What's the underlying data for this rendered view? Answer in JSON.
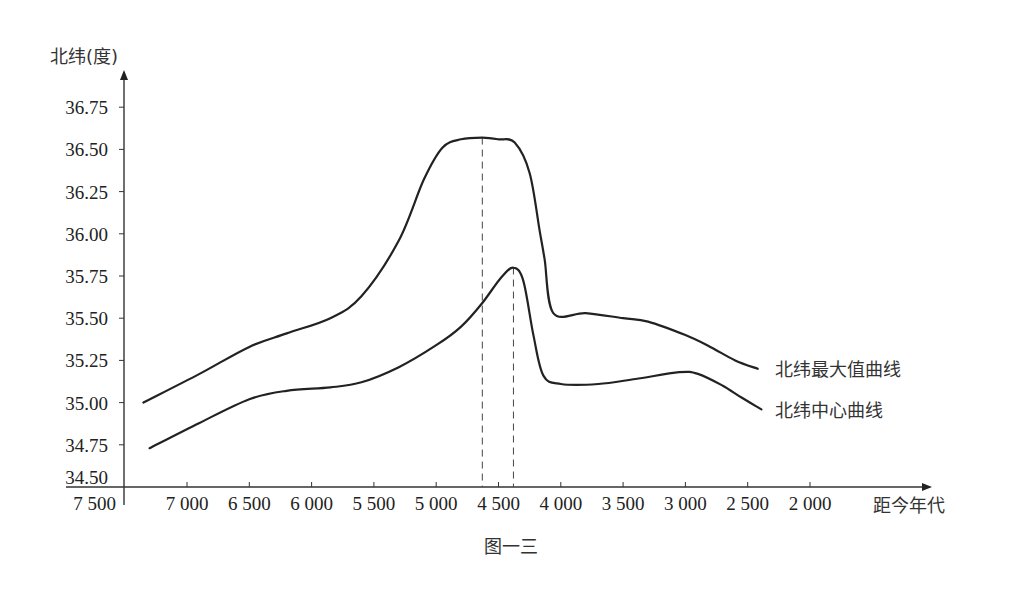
{
  "chart_data": {
    "type": "line",
    "title": "",
    "caption": "图一三",
    "xlabel": "距今年代",
    "ylabel": "北纬(度)",
    "x_reversed": true,
    "xlim": [
      7500,
      1500
    ],
    "ylim": [
      34.5,
      36.9
    ],
    "x_ticks": [
      7500,
      7000,
      6500,
      6000,
      5500,
      5000,
      4500,
      4000,
      3500,
      3000,
      2500,
      2000
    ],
    "x_tick_labels": [
      "7 500",
      "7 000",
      "6 500",
      "6 000",
      "5 500",
      "5 000",
      "4 500",
      "4 000",
      "3 500",
      "3 000",
      "2 500",
      "2 000"
    ],
    "y_ticks": [
      34.5,
      34.75,
      35.0,
      35.25,
      35.5,
      35.75,
      36.0,
      36.25,
      36.5,
      36.75
    ],
    "y_tick_labels": [
      "34.50",
      "34.75",
      "35.00",
      "35.25",
      "35.50",
      "35.75",
      "36.00",
      "36.25",
      "36.50",
      "36.75"
    ],
    "grid": false,
    "legend_position": "inline-right",
    "series": [
      {
        "name": "北纬最大值曲线",
        "x": [
          7350,
          6900,
          6500,
          6200,
          5850,
          5600,
          5300,
          5100,
          4950,
          4800,
          4630,
          4500,
          4370,
          4250,
          4170,
          4130,
          4060,
          3800,
          3500,
          3300,
          3000,
          2800,
          2600,
          2420
        ],
        "y": [
          35.0,
          35.17,
          35.33,
          35.41,
          35.5,
          35.63,
          35.96,
          36.32,
          36.51,
          36.56,
          36.57,
          36.56,
          36.54,
          36.36,
          36.02,
          35.85,
          35.53,
          35.53,
          35.5,
          35.48,
          35.4,
          35.33,
          35.25,
          35.2
        ]
      },
      {
        "name": "北纬中心曲线",
        "x": [
          7300,
          6900,
          6500,
          6200,
          5850,
          5600,
          5300,
          5000,
          4800,
          4630,
          4480,
          4380,
          4300,
          4220,
          4140,
          4000,
          3700,
          3400,
          3050,
          2900,
          2700,
          2550,
          2390
        ],
        "y": [
          34.73,
          34.88,
          35.02,
          35.07,
          35.09,
          35.12,
          35.21,
          35.34,
          35.45,
          35.59,
          35.74,
          35.8,
          35.72,
          35.4,
          35.16,
          35.11,
          35.11,
          35.14,
          35.18,
          35.17,
          35.1,
          35.03,
          34.96
        ]
      }
    ],
    "annotations": [
      {
        "type": "vline-dashed",
        "x": 4630,
        "note": "peak of 北纬最大值曲线"
      },
      {
        "type": "vline-dashed",
        "x": 4380,
        "note": "peak of 北纬中心曲线"
      }
    ]
  },
  "labels": {
    "y_axis_title": "北纬(度)",
    "x_axis_title": "距今年代",
    "legend_max": "北纬最大值曲线",
    "legend_center": "北纬中心曲线",
    "caption": "图一三"
  }
}
